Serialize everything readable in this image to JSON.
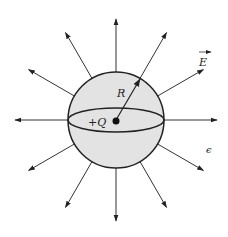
{
  "diagram": {
    "center": {
      "x": 116,
      "y": 120
    },
    "sphere": {
      "radius": 48,
      "fill": "#e3e3e3",
      "stroke": "#222222",
      "equator_ry": 12
    },
    "field_lines": {
      "count": 12,
      "inner_radius": 48,
      "outer_radius": 101,
      "color": "#333333"
    },
    "labels": {
      "charge": "+Q",
      "radius": "R",
      "field": "E",
      "permittivity": "ϵ"
    }
  }
}
